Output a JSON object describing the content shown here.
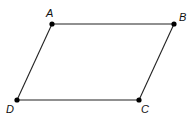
{
  "diagram": {
    "points": [
      {
        "label": "A",
        "x": 52,
        "y": 24,
        "lx": 46,
        "ly": 17
      },
      {
        "label": "B",
        "x": 174,
        "y": 24,
        "lx": 179,
        "ly": 21
      },
      {
        "label": "C",
        "x": 139,
        "y": 100,
        "lx": 141,
        "ly": 113
      },
      {
        "label": "D",
        "x": 17,
        "y": 100,
        "lx": 6,
        "ly": 113
      }
    ],
    "edges": [
      [
        "A",
        "B"
      ],
      [
        "B",
        "C"
      ],
      [
        "C",
        "D"
      ],
      [
        "D",
        "A"
      ]
    ],
    "colors": {
      "line": "#222222",
      "point": "#000000"
    }
  }
}
